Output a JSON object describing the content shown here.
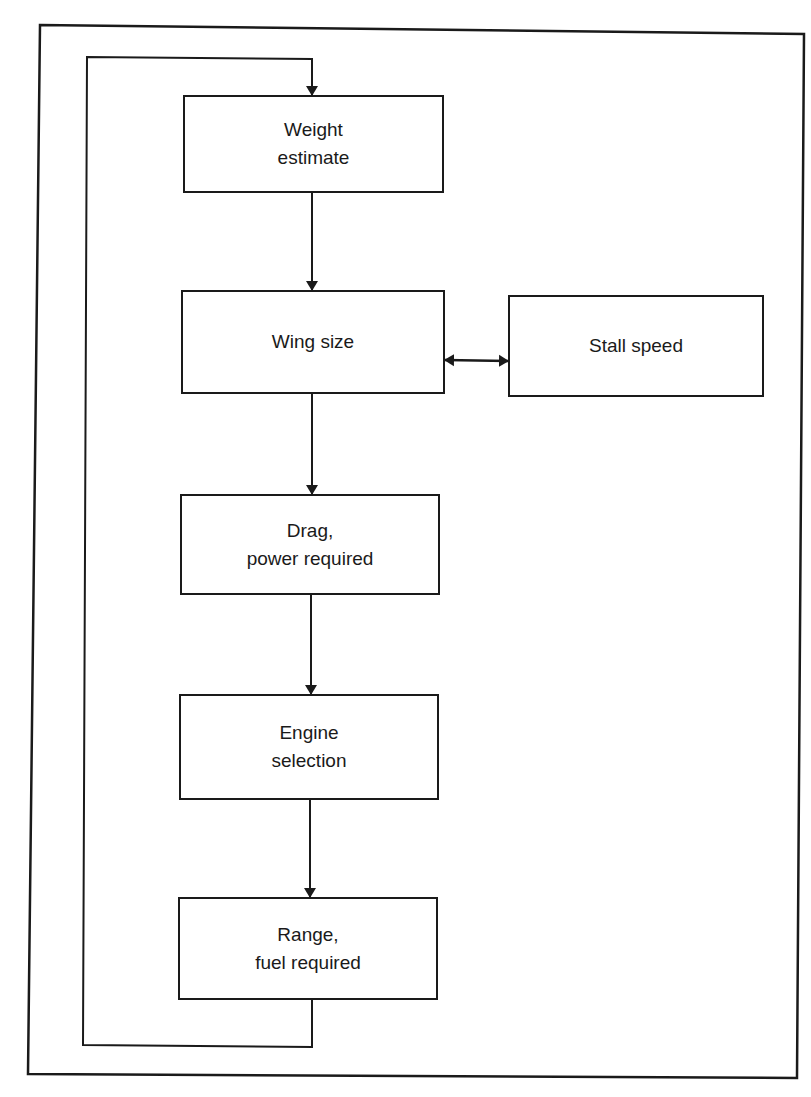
{
  "diagram": {
    "type": "flowchart",
    "nodes": [
      {
        "id": "weight",
        "lines": [
          "Weight",
          "estimate"
        ]
      },
      {
        "id": "wing",
        "lines": [
          "Wing size"
        ]
      },
      {
        "id": "stall",
        "lines": [
          "Stall speed"
        ]
      },
      {
        "id": "drag",
        "lines": [
          "Drag,",
          "power required"
        ]
      },
      {
        "id": "engine",
        "lines": [
          "Engine",
          "selection"
        ]
      },
      {
        "id": "range",
        "lines": [
          "Range,",
          "fuel required"
        ]
      }
    ],
    "edges": [
      {
        "from": "weight",
        "to": "wing",
        "style": "arrow"
      },
      {
        "from": "wing",
        "to": "stall",
        "style": "double-arrow"
      },
      {
        "from": "wing",
        "to": "drag",
        "style": "arrow"
      },
      {
        "from": "drag",
        "to": "engine",
        "style": "arrow"
      },
      {
        "from": "engine",
        "to": "range",
        "style": "arrow"
      },
      {
        "from": "range",
        "to": "weight",
        "style": "feedback-loop-arrow"
      }
    ],
    "colors": {
      "line": "#1a1a1a",
      "background": "#ffffff"
    }
  }
}
